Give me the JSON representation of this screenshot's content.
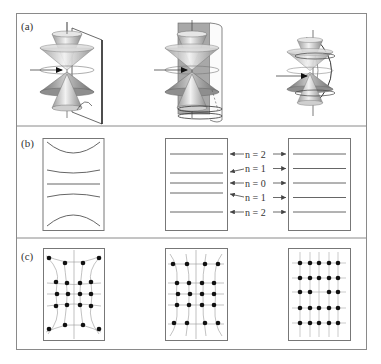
{
  "figure": {
    "panels": [
      {
        "id": "a",
        "label": "(a)",
        "subfigures": [
          {
            "name": "cones-with-plane",
            "description": "Double cone stack with vertical plane"
          },
          {
            "name": "cones-with-cylinder",
            "description": "Double cone stack with cylindrical surface"
          },
          {
            "name": "cones-with-sphere",
            "description": "Double cone stack with spherical surface"
          }
        ]
      },
      {
        "id": "b",
        "label": "(b)",
        "level_labels": [
          "n = 2",
          "n = 1",
          "n = 0",
          "n = 1",
          "n = 2"
        ],
        "subfigures": [
          {
            "name": "curved-lines-box",
            "description": "Hyperbolic curved lines"
          },
          {
            "name": "uneven-lines-box",
            "description": "Unevenly spaced horizontal lines"
          },
          {
            "name": "even-lines-box",
            "description": "Evenly spaced horizontal lines"
          }
        ]
      },
      {
        "id": "c",
        "label": "(c)",
        "subfigures": [
          {
            "name": "distorted-grid-dots",
            "description": "Distorted dot grid (pincushion)"
          },
          {
            "name": "mildly-distorted-grid-dots",
            "description": "Mildly distorted dot grid"
          },
          {
            "name": "regular-grid-dots",
            "description": "Regular 5x5 dot grid with missing center"
          }
        ]
      }
    ],
    "colors": {
      "frame": "#8a8a8a",
      "line": "#555555",
      "dot": "#111111",
      "cone_dark": "#8c8c8c",
      "cone_light": "#d8d8d8"
    }
  }
}
